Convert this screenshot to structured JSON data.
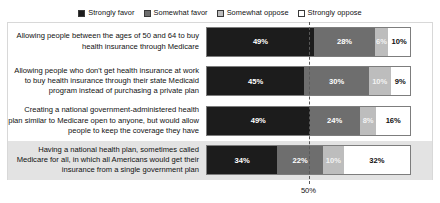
{
  "legend": {
    "items": [
      {
        "label": "Strongly favor",
        "color": "#1c1c1c",
        "swatch": "legend-swatch-strongly-favor"
      },
      {
        "label": "Somewhat favor",
        "color": "#6e6e6e",
        "swatch": "legend-swatch-somewhat-favor"
      },
      {
        "label": "Somewhat oppose",
        "color": "#bdbdbd",
        "swatch": "legend-swatch-somewhat-oppose"
      },
      {
        "label": "Strongly oppose",
        "color": "#ffffff",
        "swatch": "legend-swatch-strongly-oppose"
      }
    ]
  },
  "axis": {
    "reference_label": "50%",
    "reference_value": 50
  },
  "rows": [
    {
      "label": "Allowing people between the ages of 50 and 64 to buy health insurance through Medicare",
      "labels": [
        "49%",
        "28%",
        "6%",
        "10%"
      ],
      "highlight": false
    },
    {
      "label": "Allowing people who don't get health insurance at work to buy health insurance through their state Medicaid program instead of purchasing a private plan",
      "labels": [
        "45%",
        "30%",
        "10%",
        "9%"
      ],
      "highlight": false
    },
    {
      "label": "Creating a national government-administered health plan similar to Medicare open to anyone, but would allow people to keep the coverage they have",
      "labels": [
        "49%",
        "24%",
        "8%",
        "16%"
      ],
      "highlight": false
    },
    {
      "label": "Having a national health plan, sometimes called Medicare for all, in which all Americans would get their insurance from a single government plan",
      "labels": [
        "34%",
        "22%",
        "10%",
        "32%"
      ],
      "highlight": true
    }
  ],
  "chart_data": {
    "type": "bar",
    "subtype": "stacked-horizontal-100pct",
    "title": "",
    "subtitle": "",
    "xlabel": "",
    "ylabel": "",
    "xlim": [
      0,
      100
    ],
    "grid": false,
    "legend_position": "top-center",
    "reference_lines": [
      {
        "value": 50,
        "label": "50%",
        "style": "dashed",
        "axis": "x"
      }
    ],
    "categories": [
      "Allowing people between the ages of 50 and 64 to buy health insurance through Medicare",
      "Allowing people who don't get health insurance at work to buy health insurance through their state Medicaid program instead of purchasing a private plan",
      "Creating a national government-administered health plan similar to Medicare open to anyone, but would allow people to keep the coverage they have",
      "Having a national health plan, sometimes called Medicare for all, in which all Americans would get their insurance from a single government plan"
    ],
    "series": [
      {
        "name": "Strongly favor",
        "color": "#1c1c1c",
        "values": [
          49,
          45,
          49,
          34
        ]
      },
      {
        "name": "Somewhat favor",
        "color": "#6e6e6e",
        "values": [
          28,
          30,
          24,
          22
        ]
      },
      {
        "name": "Somewhat oppose",
        "color": "#bdbdbd",
        "values": [
          6,
          10,
          8,
          10
        ]
      },
      {
        "name": "Strongly oppose",
        "color": "#ffffff",
        "values": [
          10,
          9,
          16,
          32
        ]
      }
    ]
  }
}
